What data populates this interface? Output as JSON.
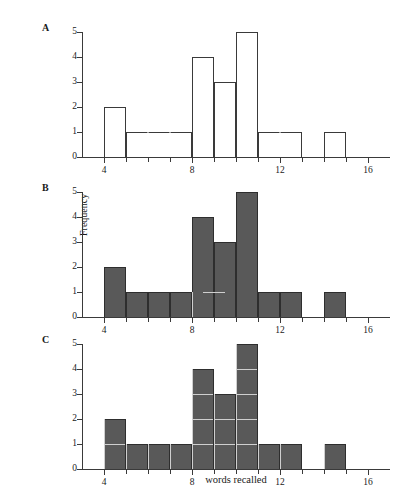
{
  "figure": {
    "panels": [
      {
        "letter": "A",
        "style": "outline"
      },
      {
        "letter": "B",
        "style": "filled"
      },
      {
        "letter": "C",
        "style": "filled-divided"
      }
    ],
    "axis": {
      "xlabel": "words recalled",
      "ylabel": "Frequency",
      "x_ticks": [
        4,
        8,
        12,
        16
      ],
      "x_tick_labels": [
        "4",
        "8",
        "12",
        "16"
      ],
      "x_minor_ticks": [
        5,
        6,
        7,
        9,
        10,
        11,
        13,
        14,
        15
      ],
      "y_ticks": [
        0,
        1,
        2,
        3,
        4,
        5
      ],
      "y_tick_labels": [
        "0",
        "1",
        "2",
        "3",
        "4",
        "5"
      ],
      "xlim": [
        3,
        17
      ],
      "ylim": [
        0,
        5
      ]
    },
    "colors": {
      "fill": "#595959",
      "outline": "#2e2e2e",
      "axis": "#3a3a3a",
      "divider": "#cfcfcf",
      "background": "#ffffff"
    }
  },
  "chart_data": {
    "type": "bar",
    "title": "",
    "xlabel": "words recalled",
    "ylabel": "Frequency",
    "xlim": [
      3,
      17
    ],
    "ylim": [
      0,
      5
    ],
    "grid": false,
    "legend": false,
    "bin_width": 1,
    "categories": [
      "4-5",
      "5-6",
      "6-7",
      "7-8",
      "8-9",
      "9-10",
      "10-11",
      "11-12",
      "12-13",
      "13-14",
      "14-15",
      "15-16"
    ],
    "bin_starts": [
      4,
      5,
      6,
      7,
      8,
      9,
      10,
      11,
      12,
      13,
      14,
      15
    ],
    "values": [
      2,
      1,
      1,
      1,
      4,
      3,
      5,
      1,
      1,
      0,
      1,
      0
    ],
    "series": [
      {
        "name": "Frequency",
        "values": [
          2,
          1,
          1,
          1,
          4,
          3,
          5,
          1,
          1,
          0,
          1,
          0
        ]
      }
    ],
    "panel_note": "Panels A, B and C plot identical frequency data with different bar rendering styles."
  }
}
